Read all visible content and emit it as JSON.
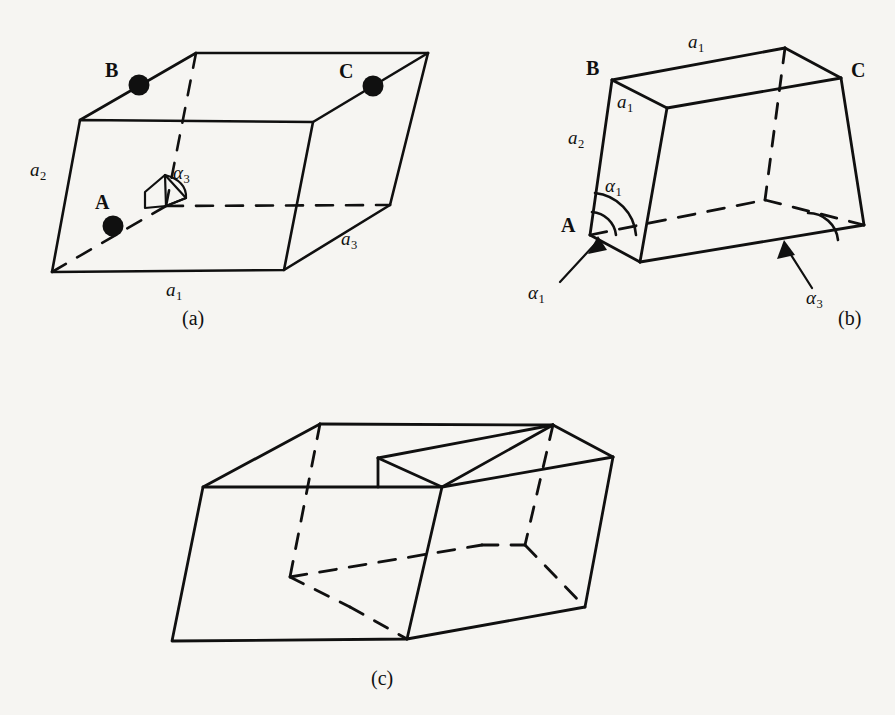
{
  "figure": {
    "background_color": "#f6f5f2",
    "ink_color": "#101010",
    "width": 895,
    "height": 715
  },
  "panels": [
    {
      "id": "a",
      "caption": "(a)",
      "description": "Orthogonal unit cell with lattice points A, B, C and angle alpha-3 marked at cell centre",
      "points": [
        {
          "name": "A",
          "label": "A"
        },
        {
          "name": "B",
          "label": "B"
        },
        {
          "name": "C",
          "label": "C"
        }
      ],
      "vectors": [
        {
          "name": "a1",
          "base": "a",
          "sub": "1"
        },
        {
          "name": "a2",
          "base": "a",
          "sub": "2"
        },
        {
          "name": "a3",
          "base": "a",
          "sub": "3"
        }
      ],
      "angles": [
        {
          "name": "alpha3",
          "base": "α",
          "sub": "3"
        }
      ]
    },
    {
      "id": "b",
      "caption": "(b)",
      "description": "Oblique sheared unit cell with points A, B, C, edge labels and angles alpha-1 and alpha-3 indicated by arrows",
      "points": [
        {
          "name": "A",
          "label": "A"
        },
        {
          "name": "B",
          "label": "B"
        },
        {
          "name": "C",
          "label": "C"
        }
      ],
      "vectors": [
        {
          "name": "a1_top",
          "base": "a",
          "sub": "1"
        },
        {
          "name": "a1_face",
          "base": "a",
          "sub": "1"
        },
        {
          "name": "a2",
          "base": "a",
          "sub": "2"
        }
      ],
      "angles": [
        {
          "name": "alpha1_arc",
          "base": "α",
          "sub": "1"
        },
        {
          "name": "alpha1_callout",
          "base": "α",
          "sub": "1"
        },
        {
          "name": "alpha3_callout",
          "base": "α",
          "sub": "3"
        }
      ]
    },
    {
      "id": "c",
      "caption": "(c)",
      "description": "Two adjoining cells forming a stepped notched block, unlabelled",
      "points": [],
      "vectors": [],
      "angles": []
    }
  ],
  "captions": {
    "a": "(a)",
    "b": "(b)",
    "c": "(c)"
  },
  "labels": {
    "a_point_B": "B",
    "a_point_C": "C",
    "a_point_A": "A",
    "a_vec_a1": "a",
    "a_vec_a1_sub": "1",
    "a_vec_a2": "a",
    "a_vec_a2_sub": "2",
    "a_vec_a3": "a",
    "a_vec_a3_sub": "3",
    "a_angle_alpha3": "α",
    "a_angle_alpha3_sub": "3",
    "b_point_B": "B",
    "b_point_C": "C",
    "b_point_A": "A",
    "b_vec_a1_top": "a",
    "b_vec_a1_top_sub": "1",
    "b_vec_a1_face": "a",
    "b_vec_a1_face_sub": "1",
    "b_vec_a2": "a",
    "b_vec_a2_sub": "2",
    "b_angle_alpha1_arc": "α",
    "b_angle_alpha1_arc_sub": "1",
    "b_angle_alpha1_callout": "α",
    "b_angle_alpha1_callout_sub": "1",
    "b_angle_alpha3_callout": "α",
    "b_angle_alpha3_callout_sub": "3"
  }
}
